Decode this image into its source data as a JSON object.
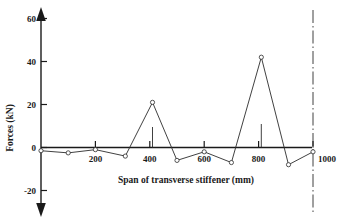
{
  "chart_data": {
    "type": "line",
    "title": "",
    "xlabel": "Span of transverse stiffener (mm)",
    "ylabel": "Forces (kN)",
    "xlim": [
      0,
      1060
    ],
    "ylim": [
      -26,
      64
    ],
    "xticks": [
      200,
      400,
      600,
      800,
      1000
    ],
    "yticks": [
      -20,
      0,
      20,
      40,
      60
    ],
    "xtick_labels": [
      "200",
      "400",
      "600",
      "800",
      "1000"
    ],
    "ytick_labels": [
      "-20",
      "0",
      "20",
      "40",
      "60"
    ],
    "grid": false,
    "legend": "none",
    "axis_style": "double-headed-arrow-y",
    "x": [
      0,
      100,
      200,
      310,
      410,
      500,
      600,
      700,
      810,
      910,
      1000
    ],
    "values": [
      -1.5,
      -2.5,
      -1.0,
      -4.0,
      21.0,
      -6.0,
      -2.0,
      -7.0,
      42.0,
      -8.0,
      -2.0
    ],
    "markers": "open-circle",
    "annotations": [
      {
        "name": "stem-at-first-peak",
        "x": 410,
        "y_from": 0,
        "y_to": 9.5
      },
      {
        "name": "stem-at-second-peak",
        "x": 810,
        "y_from": 0,
        "y_to": 11.0
      },
      {
        "name": "centerline-at-1000",
        "x": 1000,
        "style": "dash-dot"
      }
    ]
  },
  "axes": {
    "y_label": "Forces (kN)",
    "x_label": "Span of transverse stiffener (mm)",
    "y_tick_labels": [
      "60",
      "40",
      "20",
      "0",
      "-20"
    ],
    "x_tick_labels": [
      "200",
      "400",
      "600",
      "800",
      "1000"
    ]
  },
  "colors": {
    "ink": "#1a1a1a",
    "series": "#2b2b2b",
    "background": "#ffffff"
  }
}
